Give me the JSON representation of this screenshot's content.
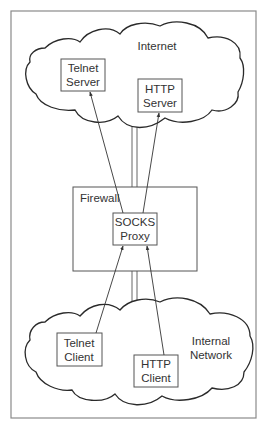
{
  "diagram": {
    "type": "network-diagram",
    "title": "",
    "regions": {
      "internet": {
        "label": "Internet"
      },
      "firewall": {
        "label": "Firewall"
      },
      "internal": {
        "label_line1": "Internal",
        "label_line2": "Network"
      }
    },
    "nodes": {
      "telnet_server": {
        "line1": "Telnet",
        "line2": "Server"
      },
      "http_server": {
        "line1": "HTTP",
        "line2": "Server"
      },
      "socks_proxy": {
        "line1": "SOCKS",
        "line2": "Proxy"
      },
      "telnet_client": {
        "line1": "Telnet",
        "line2": "Client"
      },
      "http_client": {
        "line1": "HTTP",
        "line2": "Client"
      }
    },
    "edges": [
      {
        "from": "telnet_client",
        "to": "socks_proxy",
        "arrow": "to"
      },
      {
        "from": "http_client",
        "to": "socks_proxy",
        "arrow": "to"
      },
      {
        "from": "socks_proxy",
        "to": "telnet_server",
        "arrow": "to"
      },
      {
        "from": "socks_proxy",
        "to": "http_server",
        "arrow": "to"
      }
    ],
    "colors": {
      "line": "#333333",
      "frame": "#8a8a8a",
      "background": "#ffffff"
    }
  }
}
